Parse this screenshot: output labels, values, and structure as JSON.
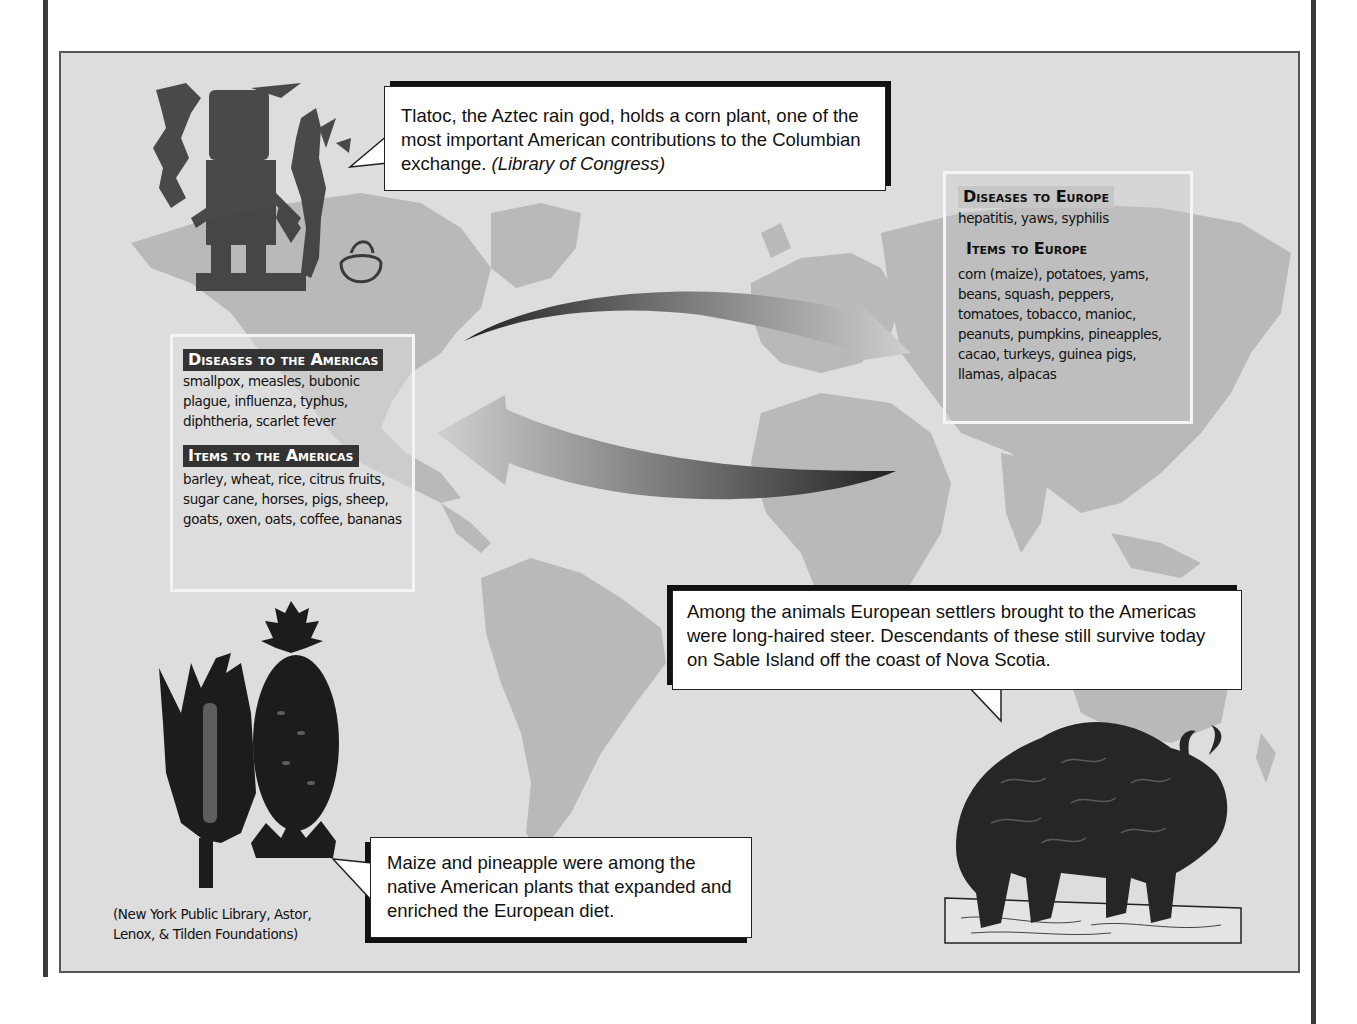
{
  "page": {
    "background": "#ffffff",
    "frame_background": "#dddddd",
    "land_color": "#b9b9b9"
  },
  "callouts": {
    "tlaloc": {
      "text": "Tlatoc, the Aztec rain god, holds a corn plant, one of the most important American contributions to the Columbian exchange.",
      "credit": "(Library of Congress)"
    },
    "steer": {
      "text": "Among the animals European settlers brought to the Americas were long-haired steer. Descendants of these still survive today on Sable Island off the coast of Nova Scotia."
    },
    "maize": {
      "text": "Maize and pineapple were among the native American plants that expanded and enriched the European diet."
    }
  },
  "to_americas": {
    "diseases_heading": "Diseases to the Americas",
    "diseases": "smallpox, measles, bubonic plague, influenza, typhus, diphtheria, scarlet fever",
    "items_heading": "Items to the Americas",
    "items": "barley, wheat, rice, citrus fruits, sugar cane, horses, pigs, sheep, goats, oxen, oats, coffee, bananas"
  },
  "to_europe": {
    "diseases_heading": "Diseases to Europe",
    "diseases": "hepatitis, yaws, syphilis",
    "items_heading": "Items to Europe",
    "items": "corn (maize), potatoes, yams, beans, squash, peppers, tomatoes, tobacco, manioc, peanuts, pumpkins, pineapples, cacao, turkeys, guinea pigs, llamas, alpacas"
  },
  "image_credits": {
    "plants": "(New York Public Library, Astor, Lenox, & Tilden Foundations)"
  },
  "illustrations": {
    "tlaloc": "tlaloc-rain-god-illustration",
    "maize": "maize-ear-illustration",
    "pineapple": "pineapple-illustration",
    "steer": "long-haired-steer-illustration",
    "arrows": "exchange-arrows"
  }
}
